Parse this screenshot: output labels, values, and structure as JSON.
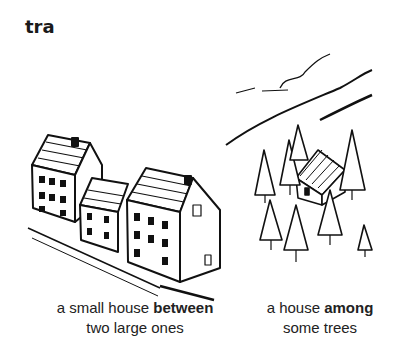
{
  "heading": "tra",
  "illustrations": [
    {
      "name": "houses",
      "caption": {
        "pre": "a small house ",
        "bold": "between",
        "line2": "two large ones"
      }
    },
    {
      "name": "trees",
      "caption": {
        "pre": "a house ",
        "bold": "among",
        "line2": "some trees"
      }
    }
  ]
}
